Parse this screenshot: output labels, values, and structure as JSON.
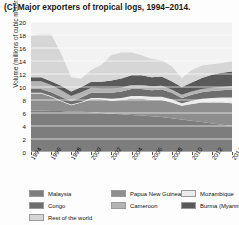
{
  "title": {
    "panel_label": "(C)",
    "text": "Major exporters of tropical logs, 1994–2014."
  },
  "axes": {
    "ylabel": "Volume (millions of cubic meters)",
    "yticks": [
      "0",
      "2",
      "4",
      "6",
      "8",
      "10",
      "12",
      "14",
      "16",
      "18",
      "20"
    ],
    "xticks": [
      "1994",
      "1996",
      "1998",
      "2000",
      "2002",
      "2004",
      "2006",
      "2008",
      "2010",
      "2012",
      "2014"
    ]
  },
  "legend": {
    "items": [
      {
        "label": "Malaysia",
        "color": "#7d7d7d"
      },
      {
        "label": "Papua New Guinea",
        "color": "#8e8e8e"
      },
      {
        "label": "Mozambique",
        "color": "#ececec"
      },
      {
        "label": "Congo",
        "color": "#6e6e6e"
      },
      {
        "label": "Cameroon",
        "color": "#b4b4b4"
      },
      {
        "label": "Burma (Myanmar)",
        "color": "#5a5a5a"
      },
      {
        "label": "Rest of the world",
        "color": "#d6d6d6"
      }
    ]
  },
  "chart_data": {
    "type": "area",
    "title": "Major exporters of tropical logs, 1994–2014.",
    "xlabel": "",
    "ylabel": "Volume (millions of cubic meters)",
    "xlim": [
      1994,
      2014
    ],
    "ylim": [
      0,
      20
    ],
    "grid": true,
    "stacked": true,
    "legend_position": "bottom",
    "x": [
      1994,
      1995,
      1996,
      1997,
      1998,
      1999,
      2000,
      2001,
      2002,
      2003,
      2004,
      2005,
      2006,
      2007,
      2008,
      2009,
      2010,
      2011,
      2012,
      2013,
      2014
    ],
    "series": [
      {
        "name": "Malaysia",
        "color": "#7d7d7d",
        "values": [
          6.4,
          6.4,
          6.3,
          6.3,
          6.2,
          6.2,
          6.1,
          6.0,
          5.9,
          5.8,
          5.7,
          5.6,
          5.5,
          5.4,
          5.2,
          5.0,
          4.8,
          4.6,
          4.4,
          4.2,
          4.0
        ]
      },
      {
        "name": "Papua New Guinea",
        "color": "#8e8e8e",
        "values": [
          2.6,
          2.6,
          2.2,
          1.5,
          1.0,
          1.4,
          2.0,
          2.1,
          2.0,
          2.2,
          2.5,
          2.6,
          2.5,
          2.6,
          2.4,
          2.1,
          2.6,
          3.0,
          3.2,
          3.4,
          3.5
        ]
      },
      {
        "name": "Mozambique",
        "color": "#ececec",
        "values": [
          0.1,
          0.1,
          0.1,
          0.1,
          0.1,
          0.1,
          0.2,
          0.2,
          0.3,
          0.3,
          0.4,
          0.4,
          0.5,
          0.5,
          0.5,
          0.4,
          0.5,
          0.6,
          0.7,
          0.8,
          0.9
        ]
      },
      {
        "name": "Congo",
        "color": "#6e6e6e",
        "values": [
          0.6,
          0.6,
          0.6,
          0.6,
          0.5,
          0.7,
          0.8,
          0.8,
          0.9,
          1.0,
          1.1,
          1.1,
          1.0,
          1.1,
          1.0,
          0.8,
          0.9,
          1.0,
          1.1,
          1.1,
          1.2
        ]
      },
      {
        "name": "Cameroon",
        "color": "#b4b4b4",
        "values": [
          1.2,
          1.2,
          1.1,
          1.0,
          0.8,
          0.8,
          0.8,
          0.7,
          0.7,
          0.6,
          0.6,
          0.6,
          0.6,
          0.6,
          0.5,
          0.5,
          0.5,
          0.5,
          0.5,
          0.5,
          0.5
        ]
      },
      {
        "name": "Burma (Myanmar)",
        "color": "#5a5a5a",
        "values": [
          0.6,
          0.6,
          0.6,
          0.7,
          0.7,
          0.8,
          0.9,
          1.0,
          1.2,
          1.4,
          1.5,
          1.5,
          1.4,
          1.4,
          1.3,
          1.2,
          1.4,
          1.7,
          2.0,
          2.2,
          2.3
        ]
      },
      {
        "name": "Rest of the world",
        "color": "#d6d6d6",
        "values": [
          6.4,
          6.6,
          7.2,
          4.9,
          2.2,
          1.3,
          1.8,
          2.6,
          3.9,
          4.0,
          3.5,
          3.1,
          2.8,
          2.5,
          2.3,
          1.4,
          1.9,
          1.9,
          1.6,
          1.5,
          1.6
        ]
      }
    ]
  }
}
